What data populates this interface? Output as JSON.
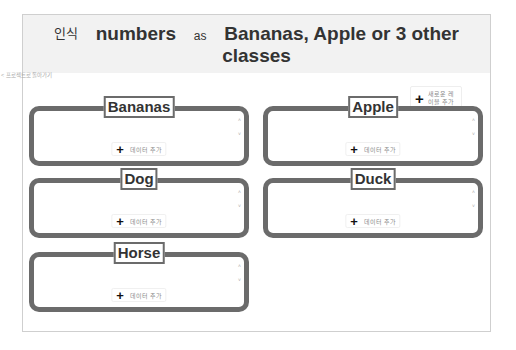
{
  "header": {
    "prefix": "인식",
    "subject": "numbers",
    "connector": "as",
    "classes_line1": "Bananas, Apple or 3 other",
    "classes_line2": "classes"
  },
  "back_link": "< 프로젝트로 돌아가기",
  "add_label_button": {
    "icon": "plus-icon",
    "label": "새로운 레이블 추가"
  },
  "cards": [
    {
      "title": "Bananas",
      "add_data_label": "데이터 추가",
      "left": 6,
      "top": 105
    },
    {
      "title": "Apple",
      "add_data_label": "데이터 추가",
      "left": 240,
      "top": 105
    },
    {
      "title": "Dog",
      "add_data_label": "데이터 추가",
      "left": 6,
      "top": 177
    },
    {
      "title": "Duck",
      "add_data_label": "데이터 추가",
      "left": 240,
      "top": 177
    },
    {
      "title": "Horse",
      "add_data_label": "데이터 추가",
      "left": 6,
      "top": 251
    }
  ],
  "colors": {
    "header_bg": "#f2f2f2",
    "card_border": "#6b6b6b",
    "text": "#333333"
  }
}
